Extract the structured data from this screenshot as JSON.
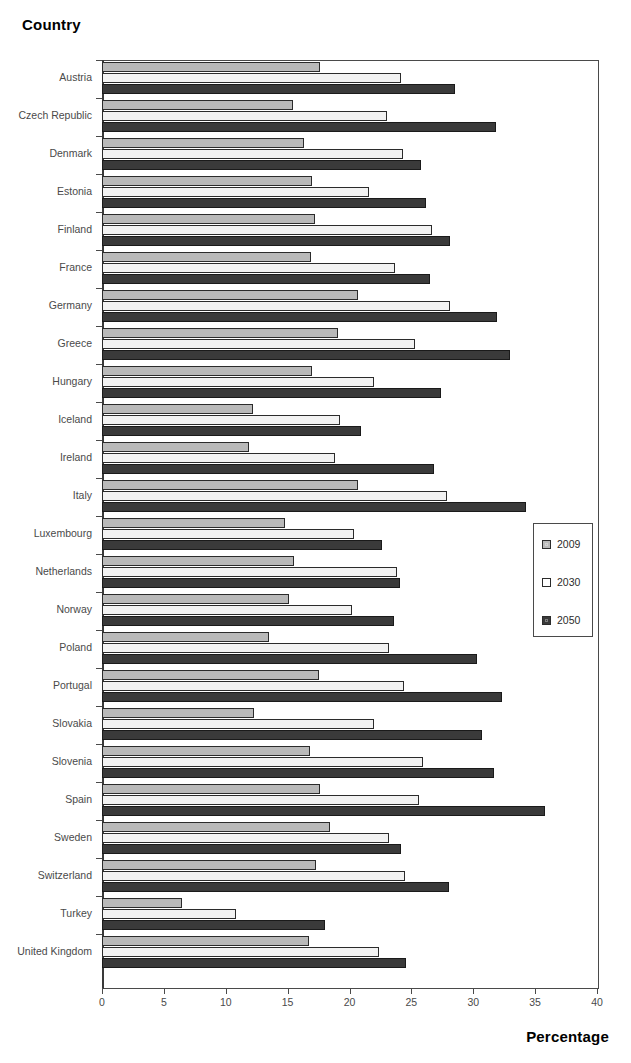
{
  "axes": {
    "y_title": "Country",
    "x_title": "Percentage",
    "x_ticks": [
      "0",
      "5",
      "10",
      "15",
      "20",
      "25",
      "30",
      "35",
      "40"
    ]
  },
  "legend": {
    "items": [
      {
        "label": "2009",
        "color": "#b9b9b9",
        "swatch": "s2009"
      },
      {
        "label": "2030",
        "color": "#ffffff",
        "swatch": "s2030"
      },
      {
        "label": "2050",
        "color": "#3a3a3a",
        "swatch": "s2050"
      }
    ]
  },
  "chart_data": {
    "type": "bar",
    "orientation": "horizontal",
    "title": "",
    "xlabel": "Percentage",
    "ylabel": "Country",
    "xlim": [
      0,
      40
    ],
    "xticks": [
      0,
      5,
      10,
      15,
      20,
      25,
      30,
      35,
      40
    ],
    "grid": false,
    "legend_position": "right-middle",
    "categories": [
      "Austria",
      "Czech Republic",
      "Denmark",
      "Estonia",
      "Finland",
      "France",
      "Germany",
      "Greece",
      "Hungary",
      "Iceland",
      "Ireland",
      "Italy",
      "Luxembourg",
      "Netherlands",
      "Norway",
      "Poland",
      "Portugal",
      "Slovakia",
      "Slovenia",
      "Spain",
      "Sweden",
      "Switzerland",
      "Turkey",
      "United Kingdom"
    ],
    "series": [
      {
        "name": "2009",
        "color": "#b9b9b9",
        "values": [
          17.6,
          15.4,
          16.3,
          17.0,
          17.2,
          16.9,
          20.7,
          19.1,
          17.0,
          12.2,
          11.9,
          20.7,
          14.8,
          15.5,
          15.1,
          13.5,
          17.5,
          12.3,
          16.8,
          17.6,
          18.4,
          17.3,
          6.5,
          16.7
        ]
      },
      {
        "name": "2030",
        "color": "#f2f2f2",
        "values": [
          24.2,
          23.0,
          24.3,
          21.6,
          26.7,
          23.7,
          28.1,
          25.3,
          22.0,
          19.2,
          18.8,
          27.9,
          20.4,
          23.8,
          20.2,
          23.2,
          24.4,
          22.0,
          25.9,
          25.6,
          23.2,
          24.5,
          10.8,
          22.4
        ]
      },
      {
        "name": "2050",
        "color": "#3a3a3a",
        "values": [
          28.5,
          31.8,
          25.8,
          26.2,
          28.1,
          26.5,
          31.9,
          33.0,
          27.4,
          20.9,
          26.8,
          34.3,
          22.6,
          24.1,
          23.6,
          30.3,
          32.3,
          30.7,
          31.7,
          35.8,
          24.2,
          28.0,
          18.0,
          24.6
        ]
      }
    ]
  }
}
